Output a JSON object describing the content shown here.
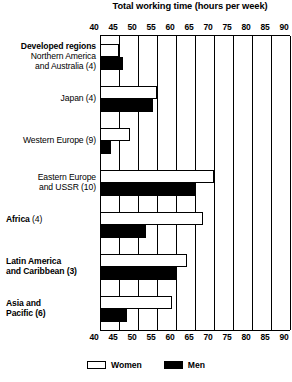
{
  "chart_data": {
    "type": "bar",
    "orientation": "horizontal",
    "title": "Total working time (hours per week)",
    "xlabel": "",
    "ylabel": "",
    "xlim": [
      40,
      90
    ],
    "xticks": [
      40,
      45,
      50,
      55,
      60,
      65,
      70,
      75,
      80,
      85,
      90
    ],
    "grid": true,
    "legend_position": "bottom",
    "categories": [
      "Developed regions Northern America and Australia (4)",
      "Japan (4)",
      "Western Europe (9)",
      "Eastern Europe and USSR (10)",
      "Africa (4)",
      "Latin America and Caribbean (3)",
      "Asia and Pacific (6)"
    ],
    "series": [
      {
        "name": "Women",
        "color": "#ffffff",
        "values": [
          45,
          55,
          48,
          70,
          67,
          63,
          59
        ]
      },
      {
        "name": "Men",
        "color": "#000000",
        "values": [
          46,
          54,
          43,
          65,
          52,
          60,
          47
        ]
      }
    ]
  },
  "title": "Total working time (hours per week)",
  "axis": {
    "ticks": [
      "40",
      "45",
      "50",
      "55",
      "60",
      "65",
      "70",
      "75",
      "80",
      "85",
      "90"
    ]
  },
  "groups": [
    {
      "id": "developed-regions",
      "label_lines": [
        {
          "text": "Developed regions",
          "bold": true
        },
        {
          "text": "Northern America",
          "bold": false
        },
        {
          "text": "and Australia (4)",
          "bold": false
        }
      ],
      "label_align": "right",
      "women": 45,
      "men": 46
    },
    {
      "id": "japan",
      "label_lines": [
        {
          "text": "Japan (4)",
          "bold": false
        }
      ],
      "label_align": "right",
      "women": 55,
      "men": 54
    },
    {
      "id": "western-europe",
      "label_lines": [
        {
          "text": "Western Europe (9)",
          "bold": false
        }
      ],
      "label_align": "right",
      "women": 48,
      "men": 43
    },
    {
      "id": "eastern-europe-ussr",
      "label_lines": [
        {
          "text": "Eastern Europe",
          "bold": false
        },
        {
          "text": "and USSR (10)",
          "bold": false
        }
      ],
      "label_align": "right",
      "women": 70,
      "men": 65
    },
    {
      "id": "africa",
      "label_lines": [
        {
          "text": "Africa",
          "bold": true
        },
        {
          "text": " (4)",
          "bold": false
        }
      ],
      "label_align": "left",
      "women": 67,
      "men": 52
    },
    {
      "id": "latin-america-caribbean",
      "label_lines": [
        {
          "text": "Latin America",
          "bold": true
        },
        {
          "text": "and Caribbean (3)",
          "bold": true
        }
      ],
      "label_align": "left",
      "women": 63,
      "men": 60
    },
    {
      "id": "asia-pacific",
      "label_lines": [
        {
          "text": "Asia and",
          "bold": true
        },
        {
          "text": "Pacific (6)",
          "bold": true
        }
      ],
      "label_align": "left",
      "women": 59,
      "men": 47
    }
  ],
  "legend": [
    {
      "id": "women",
      "label": "Women",
      "swatch": "white"
    },
    {
      "id": "men",
      "label": "Men",
      "swatch": "black"
    }
  ]
}
